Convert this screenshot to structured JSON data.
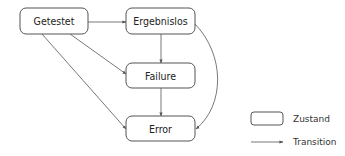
{
  "diagram": {
    "type": "state-diagram",
    "nodes": [
      {
        "id": "getestet",
        "label": "Getestet"
      },
      {
        "id": "ergebnislos",
        "label": "Ergebnislos"
      },
      {
        "id": "failure",
        "label": "Failure"
      },
      {
        "id": "error",
        "label": "Error"
      }
    ],
    "edges": [
      {
        "from": "getestet",
        "to": "ergebnislos"
      },
      {
        "from": "getestet",
        "to": "failure"
      },
      {
        "from": "getestet",
        "to": "error"
      },
      {
        "from": "ergebnislos",
        "to": "failure"
      },
      {
        "from": "ergebnislos",
        "to": "error"
      },
      {
        "from": "failure",
        "to": "error"
      }
    ],
    "legend": {
      "state_label": "Zustand",
      "transition_label": "Transition"
    }
  }
}
